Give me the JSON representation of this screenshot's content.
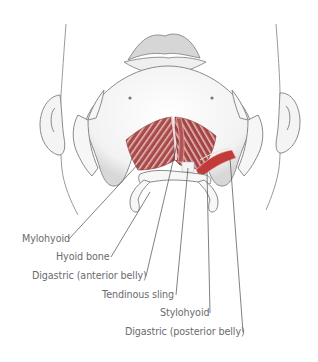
{
  "figure": {
    "colors": {
      "muscle": "#a84a4a",
      "muscle_dark": "#8a3434",
      "muscle_stripe": "#e8c4c0",
      "bone_outline": "#8a8a8a",
      "skin_outline": "#9a9a9a",
      "label_text": "#6b6b6b",
      "leader_line": "#4a4a4a",
      "background": "#ffffff"
    },
    "labels": [
      {
        "id": "mylohyoid",
        "text": "Mylohyoid"
      },
      {
        "id": "hyoid-bone",
        "text": "Hyoid bone"
      },
      {
        "id": "digastric-anterior",
        "text": "Digastric (anterior belly)"
      },
      {
        "id": "tendinous-sling",
        "text": "Tendinous sling"
      },
      {
        "id": "stylohyoid",
        "text": "Stylohyoid"
      },
      {
        "id": "digastric-posterior",
        "text": "Digastric (posterior belly)"
      }
    ]
  }
}
